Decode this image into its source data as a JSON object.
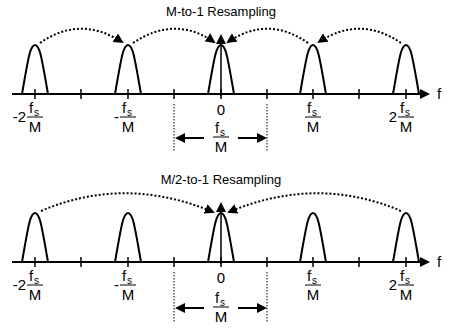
{
  "panels": [
    {
      "title": "M-to-1 Resampling",
      "axis_label": "f",
      "zero_label": "0",
      "tick_labels": [
        {
          "prefix": "-2",
          "num": "f",
          "num_sub": "s",
          "den": "M"
        },
        {
          "prefix": "-",
          "num": "f",
          "num_sub": "s",
          "den": "M"
        },
        {
          "prefix": "",
          "num": "f",
          "num_sub": "s",
          "den": "M"
        },
        {
          "prefix": "2",
          "num": "f",
          "num_sub": "s",
          "den": "M"
        }
      ],
      "band_label": {
        "num": "f",
        "num_sub": "s",
        "den": "M"
      },
      "description": "Each spectral image shifts by fs/M to its neighbor; all alias onto 0"
    },
    {
      "title": "M/2-to-1 Resampling",
      "axis_label": "f",
      "zero_label": "0",
      "tick_labels": [
        {
          "prefix": "-2",
          "num": "f",
          "num_sub": "s",
          "den": "M"
        },
        {
          "prefix": "-",
          "num": "f",
          "num_sub": "s",
          "den": "M"
        },
        {
          "prefix": "",
          "num": "f",
          "num_sub": "s",
          "den": "M"
        },
        {
          "prefix": "2",
          "num": "f",
          "num_sub": "s",
          "den": "M"
        }
      ],
      "band_label": {
        "num": "f",
        "num_sub": "s",
        "den": "M"
      },
      "description": "Only images at ±2fs/M alias onto 0"
    }
  ],
  "colors": {
    "ink": "#000000",
    "background": "#ffffff"
  }
}
